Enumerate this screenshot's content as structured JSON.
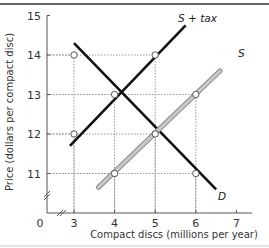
{
  "chart_data": {
    "type": "line",
    "title": "",
    "xlabel": "Compact discs (millions per year)",
    "ylabel": "Price (dollars per compact disc)",
    "x_ticks": [
      "3",
      "4",
      "5",
      "6",
      "7"
    ],
    "y_ticks": [
      "11",
      "12",
      "13",
      "14",
      "15"
    ],
    "origin_label": "0",
    "xlim": [
      0,
      7
    ],
    "ylim": [
      0,
      15
    ],
    "axis_breaks": true,
    "grid": "dotted guide lines at key points",
    "series": [
      {
        "name": "D",
        "label": "D",
        "color": "#111111",
        "points": [
          [
            3.0,
            14.3
          ],
          [
            6.5,
            10.6
          ]
        ]
      },
      {
        "name": "S + tax",
        "label": "S + tax",
        "color": "#111111",
        "points": [
          [
            2.9,
            11.7
          ],
          [
            5.75,
            14.75
          ]
        ]
      },
      {
        "name": "S",
        "label": "S",
        "color": "#a8a8a8",
        "points": [
          [
            3.6,
            10.65
          ],
          [
            6.6,
            13.6
          ]
        ]
      }
    ],
    "marked_points": [
      {
        "x": 3,
        "y": 14,
        "note": "D at price 14"
      },
      {
        "x": 3,
        "y": 12,
        "note": "S + tax at price 12"
      },
      {
        "x": 4,
        "y": 13,
        "note": "Equilibrium with tax"
      },
      {
        "x": 4,
        "y": 11,
        "note": "S at price 11"
      },
      {
        "x": 5,
        "y": 14,
        "note": "S + tax at price 14"
      },
      {
        "x": 5,
        "y": 12,
        "note": "Equilibrium without tax"
      },
      {
        "x": 6,
        "y": 13,
        "note": "S at price 13"
      },
      {
        "x": 6,
        "y": 11,
        "note": "D at price 11"
      }
    ]
  }
}
